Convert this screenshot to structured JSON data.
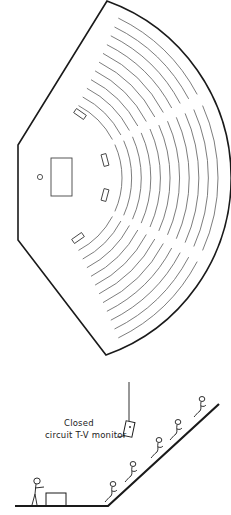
{
  "diagram": {
    "type": "architectural-plan-and-section",
    "plan": {
      "description": "Fan-shaped lecture hall floor plan with curved seating rows",
      "seating_rows": 11,
      "aisles": 2,
      "features": [
        "lectern-table",
        "speaker-position-circle",
        "tv-monitors"
      ],
      "monitor_count": 4
    },
    "section": {
      "description": "Cross-section showing raked seating with seated audience and presenter at table",
      "audience_figures": 5,
      "presenter_figures": 1,
      "label": {
        "line1": "Closed",
        "line2": "circuit T-V monitor"
      }
    }
  },
  "colors": {
    "line": "#1a1a1a",
    "row_line": "#6e6e6e",
    "background": "#ffffff"
  }
}
